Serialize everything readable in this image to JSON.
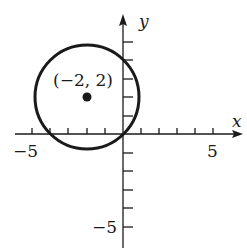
{
  "figure": {
    "type": "coordinate-plane-circle",
    "axes": {
      "x_label": "x",
      "y_label": "y",
      "x_range": [
        -5,
        6
      ],
      "y_range": [
        -6,
        5
      ],
      "x_tick_labels": [
        {
          "value": -5,
          "text": "−5"
        },
        {
          "value": 5,
          "text": "5"
        }
      ],
      "y_tick_labels": [
        {
          "value": -5,
          "text": "−5"
        }
      ],
      "tick_step": 1
    },
    "circle": {
      "center": [
        -2,
        2
      ],
      "passes_through": [
        0,
        0
      ],
      "radius_squared": 8
    },
    "point": {
      "coords": [
        -2,
        2
      ],
      "label": "(−2, 2)"
    },
    "colors": {
      "ink": "#1a1a1a",
      "background": "#ffffff"
    }
  }
}
